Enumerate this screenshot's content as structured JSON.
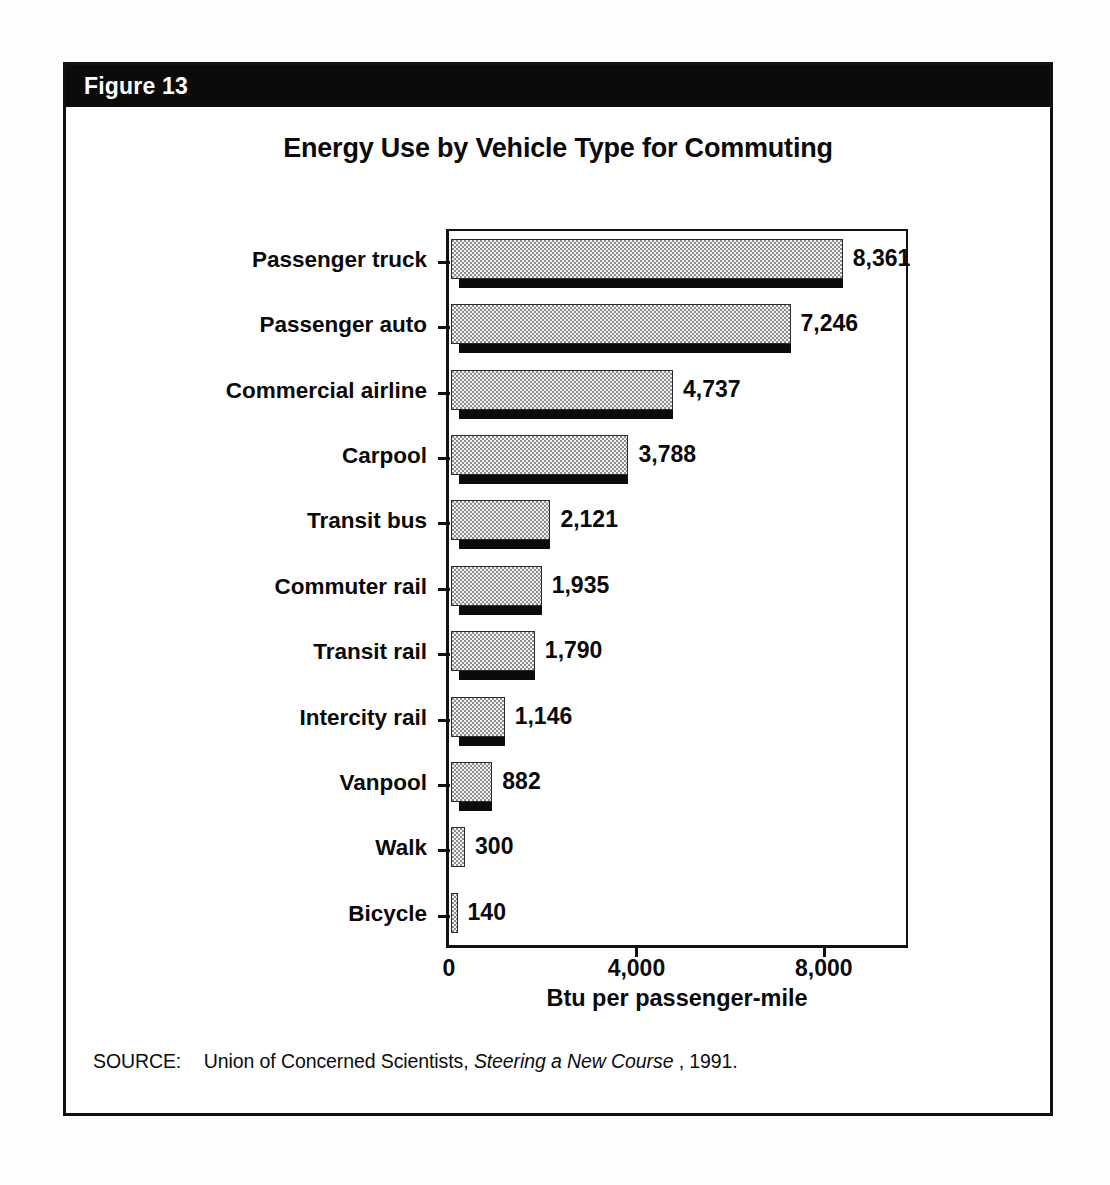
{
  "figure": {
    "number_label": "Figure 13",
    "border_color": "#111111",
    "header_bg": "#0b0b0b",
    "header_text_color": "#ffffff"
  },
  "source": {
    "label": "SOURCE:",
    "body_before": "Union of Concerned Scientists,",
    "italic_title": "Steering a New Course",
    "body_after": ", 1991."
  },
  "chart_data": {
    "type": "bar",
    "orientation": "horizontal",
    "title": "Energy Use by Vehicle Type for Commuting",
    "xlabel": "Btu per passenger-mile",
    "ylabel": "",
    "xlim": [
      0,
      9860
    ],
    "xticks": [
      0,
      4000,
      8000
    ],
    "xtick_labels": [
      "0",
      "4,000",
      "8,000"
    ],
    "grid": false,
    "legend": false,
    "bar_style": {
      "fill": "stipple",
      "fill_color": "#f2f2f2",
      "stipple_color": "#8d8d8d",
      "outline_color": "#2a2a2a",
      "shadow_color": "#0b0b0b"
    },
    "categories": [
      "Passenger truck",
      "Passenger auto",
      "Commercial airline",
      "Carpool",
      "Transit bus",
      "Commuter rail",
      "Transit rail",
      "Intercity rail",
      "Vanpool",
      "Walk",
      "Bicycle"
    ],
    "values": [
      8361,
      7246,
      4737,
      3788,
      2121,
      1935,
      1790,
      1146,
      882,
      300,
      140
    ],
    "value_labels": [
      "8,361",
      "7,246",
      "4,737",
      "3,788",
      "2,121",
      "1,935",
      "1,790",
      "1,146",
      "882",
      "300",
      "140"
    ]
  }
}
